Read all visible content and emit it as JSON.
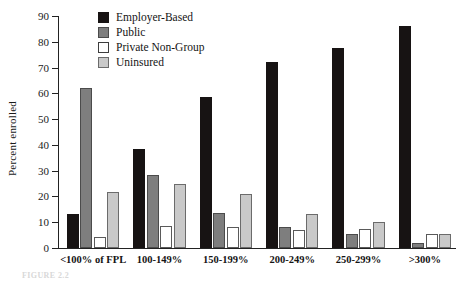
{
  "chart_data": {
    "type": "bar",
    "title": "",
    "xlabel": "",
    "ylabel": "Percent enrolled",
    "ylim": [
      0,
      90
    ],
    "ytick_step": 10,
    "yticks": [
      0,
      10,
      20,
      30,
      40,
      50,
      60,
      70,
      80,
      90
    ],
    "grid": false,
    "legend_position": "top-center",
    "categories": [
      "<100% of FPL",
      "100-149%",
      "150-199%",
      "200-249%",
      "250-299%",
      ">300%"
    ],
    "series": [
      {
        "name": "Employer-Based",
        "color": "#171313",
        "values": [
          13.2,
          38.5,
          58.5,
          72.0,
          77.5,
          86.2
        ]
      },
      {
        "name": "Public",
        "color": "#7e7e7e",
        "values": [
          62.0,
          28.2,
          13.5,
          8.2,
          5.5,
          2.0
        ]
      },
      {
        "name": "Private Non-Group",
        "color": "#ffffff",
        "values": [
          4.3,
          8.6,
          8.0,
          7.0,
          7.5,
          5.5
        ]
      },
      {
        "name": "Uninsured",
        "color": "#c9c9c9",
        "values": [
          21.8,
          24.8,
          21.0,
          13.2,
          10.2,
          5.5
        ]
      }
    ]
  },
  "axis": {
    "y_title": "Percent enrolled"
  },
  "legend": {
    "items": [
      {
        "label": "Employer-Based"
      },
      {
        "label": "Public"
      },
      {
        "label": "Private Non-Group"
      },
      {
        "label": "Uninsured"
      }
    ]
  },
  "caption": {
    "text": "FIGURE 2.2"
  }
}
